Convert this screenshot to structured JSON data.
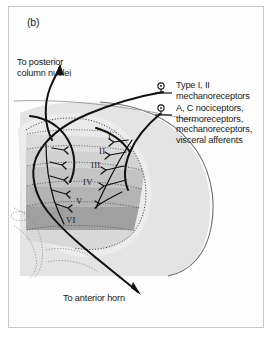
{
  "panel": {
    "label": "(b)",
    "border_color": "#c8c8c8",
    "background": "#ffffff"
  },
  "diagram": {
    "name": "spinal-cord-dorsal-horn-rexed-laminae",
    "colors": {
      "white_matter": "#e4e4e4",
      "gray_matter_outline": "#8c8c8c",
      "fiber": "#111111",
      "lamina_1": "#e9e9e9",
      "lamina_2": "#dcdcdc",
      "lamina_3": "#d2d2d2",
      "lamina_4": "#c4c4c4",
      "lamina_5": "#b4b4b4",
      "lamina_6": "#a0a0a0",
      "text": "#1a1a1a"
    }
  },
  "laminae": [
    {
      "numeral": "I",
      "x": 108,
      "y": 131
    },
    {
      "numeral": "II",
      "x": 99,
      "y": 146
    },
    {
      "numeral": "III",
      "x": 91,
      "y": 160
    },
    {
      "numeral": "IV",
      "x": 83,
      "y": 177
    },
    {
      "numeral": "V",
      "x": 76,
      "y": 196
    },
    {
      "numeral": "VI",
      "x": 66,
      "y": 215
    }
  ],
  "annotations": {
    "posterior": "To posterior\ncolumn nuclei",
    "anterior": "To anterior horn",
    "type_1_2": "Type I, II\nmechanoreceptors",
    "nociceptors": "A, C nociceptors,\nthermoreceptors,\nmechanoreceptors,\nvisceral afferents"
  },
  "receptor_symbols": [
    {
      "name": "receptor-symbol-type12",
      "cx": 161,
      "cy": 86
    },
    {
      "name": "receptor-symbol-nociceptors",
      "cx": 161,
      "cy": 108
    }
  ]
}
